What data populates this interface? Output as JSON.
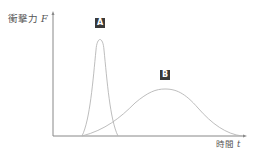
{
  "diagram": {
    "y_axis": {
      "label": "衝撃力",
      "symbol": "F"
    },
    "x_axis": {
      "label": "時間",
      "symbol": "t"
    },
    "curves": [
      {
        "label": "A",
        "description": "narrow tall spike"
      },
      {
        "label": "B",
        "description": "wide low hump"
      }
    ]
  }
}
